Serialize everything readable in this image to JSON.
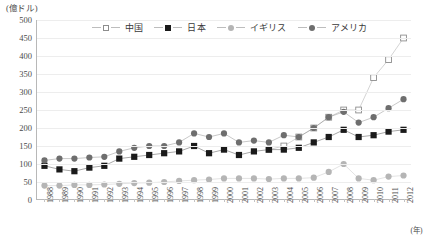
{
  "axis": {
    "y_unit_label": "(億ドル)",
    "y_ticks": [
      500,
      450,
      400,
      350,
      300,
      250,
      200,
      150,
      100,
      50,
      0
    ],
    "x_unit_label": "(年)"
  },
  "legend": {
    "entries": [
      {
        "label": "中国",
        "marker": "square-open",
        "color": "#8d8d8d"
      },
      {
        "label": "日本",
        "marker": "square-filled",
        "color": "#1a1a1a"
      },
      {
        "label": "イギリス",
        "marker": "circle-light",
        "color": "#b5b5b5"
      },
      {
        "label": "アメリカ",
        "marker": "circle-dark",
        "color": "#6e6e6e"
      }
    ]
  },
  "chart_data": {
    "type": "line",
    "title": "",
    "xlabel": "(年)",
    "ylabel": "(億ドル)",
    "ylim": [
      0,
      500
    ],
    "grid": true,
    "legend_position": "top-inside",
    "categories": [
      "1988",
      "1989",
      "1990",
      "1991",
      "1992",
      "1993",
      "1994",
      "1995",
      "1996",
      "1997",
      "1998",
      "1999",
      "2000",
      "2001",
      "2002",
      "2003",
      "2004",
      "2005",
      "2006",
      "2007",
      "2008",
      "2009",
      "2010",
      "2011",
      "2012"
    ],
    "series": [
      {
        "name": "中国",
        "marker": "square-open",
        "color": "#8d8d8d",
        "values": [
          null,
          null,
          null,
          null,
          null,
          null,
          null,
          null,
          null,
          null,
          null,
          null,
          null,
          null,
          null,
          140,
          150,
          175,
          200,
          230,
          250,
          250,
          340,
          390,
          450
        ]
      },
      {
        "name": "日本",
        "marker": "square-filled",
        "color": "#1a1a1a",
        "values": [
          95,
          85,
          80,
          90,
          95,
          115,
          120,
          125,
          130,
          135,
          150,
          130,
          140,
          125,
          135,
          140,
          140,
          145,
          160,
          175,
          195,
          175,
          180,
          190,
          195
        ]
      },
      {
        "name": "イギリス",
        "marker": "circle-light",
        "color": "#b5b5b5",
        "values": [
          40,
          40,
          42,
          42,
          43,
          45,
          47,
          48,
          50,
          53,
          55,
          57,
          60,
          60,
          60,
          58,
          60,
          60,
          62,
          78,
          100,
          60,
          55,
          65,
          68
        ]
      },
      {
        "name": "アメリカ",
        "marker": "circle-dark",
        "color": "#6e6e6e",
        "values": [
          110,
          115,
          115,
          118,
          120,
          135,
          145,
          150,
          150,
          160,
          185,
          175,
          185,
          160,
          165,
          160,
          180,
          175,
          200,
          230,
          245,
          215,
          230,
          255,
          280
        ]
      }
    ]
  }
}
